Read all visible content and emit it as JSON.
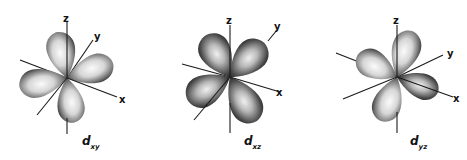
{
  "figure": {
    "panels": [
      {
        "id": "dxy",
        "label_main": "d",
        "label_sub": "xy",
        "axes": {
          "z": "z",
          "y": "y",
          "x": "x"
        }
      },
      {
        "id": "dxz",
        "label_main": "d",
        "label_sub": "xz",
        "axes": {
          "z": "z",
          "y": "y",
          "x": "x"
        }
      },
      {
        "id": "dyz",
        "label_main": "d",
        "label_sub": "yz",
        "axes": {
          "z": "z",
          "y": "y",
          "x": "x"
        }
      }
    ],
    "colors": {
      "lobe_highlight": "#f4f4f4",
      "lobe_shadow": "#2a2a2a",
      "axis": "#1a1a1a"
    }
  }
}
